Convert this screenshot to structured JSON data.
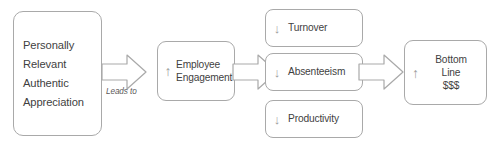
{
  "diagram": {
    "stroke_color": "#a9a9a9",
    "text_color": "#3f3f3f",
    "arrow_glyph_color": "#9b9b9b",
    "background": "#ffffff",
    "connector_label": "Leads to",
    "icons": {
      "up": "↑",
      "down": "↓"
    },
    "nodes": {
      "appreciation": {
        "label": "Personally\nRelevant\nAuthentic\nAppreciation",
        "trend": "none"
      },
      "engagement": {
        "label": "Employee\nEngagement",
        "trend": "up",
        "trend_glyph": "↑"
      },
      "turnover": {
        "label": "Turnover",
        "trend": "down",
        "trend_glyph": "↓"
      },
      "absenteeism": {
        "label": "Absenteeism",
        "trend": "down",
        "trend_glyph": "↓"
      },
      "productivity": {
        "label": "Productivity",
        "trend": "down",
        "trend_glyph": "↓"
      },
      "bottomline": {
        "label": "Bottom\nLine\n$$$",
        "trend": "up",
        "trend_glyph": "↑"
      }
    }
  }
}
